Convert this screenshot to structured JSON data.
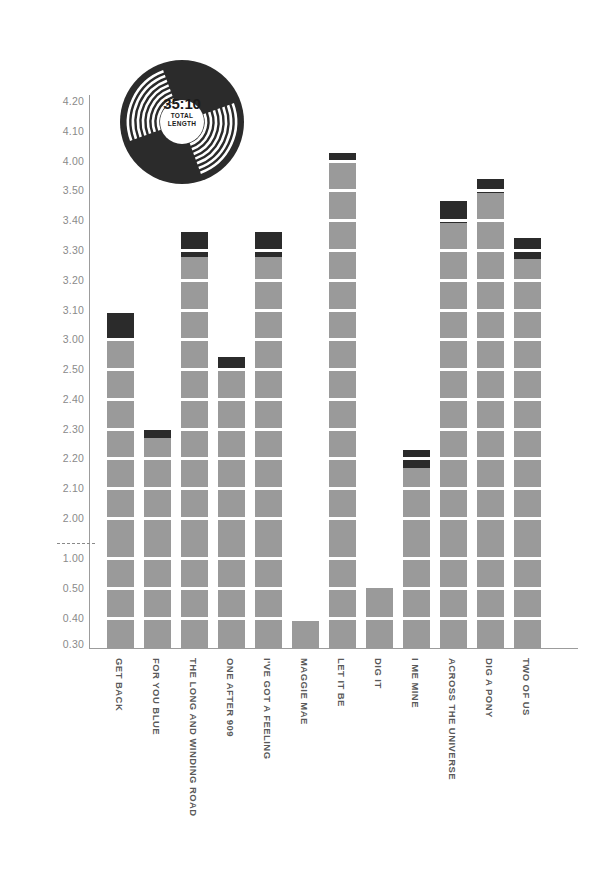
{
  "badge": {
    "total_length": "35:10",
    "caption_line1": "TOTAL",
    "caption_line2": "LENGTH",
    "icon": "vinyl-record-icon"
  },
  "colors": {
    "bar": "#9a9a9a",
    "bar_cap": "#2b2b2b",
    "axis": "#9c9c9c",
    "tick_text": "#8a8a8a",
    "label_text": "#595959",
    "background": "#ffffff"
  },
  "axis": {
    "y_ticks": [
      "4.20",
      "4.10",
      "4.00",
      "3.50",
      "3.40",
      "3.30",
      "3.20",
      "3.10",
      "3.00",
      "2.50",
      "2.40",
      "2.30",
      "2.20",
      "2.10",
      "2.00",
      "1.00",
      "0.50",
      "0.40",
      "0.30"
    ],
    "break_after": "2.00",
    "break_marker": "dashed"
  },
  "chart_data": {
    "type": "bar",
    "title": "",
    "subtitle": "",
    "xlabel": "",
    "ylabel": "",
    "grid": true,
    "legend": "none",
    "note": "Track lengths in minutes:seconds shown as min.sec on a broken y-axis; dark cap marks the seconds portion above the last whole gridline.",
    "ylim": [
      0.3,
      4.25
    ],
    "categories": [
      "GET BACK",
      "FOR YOU BLUE",
      "THE LONG AND WINDING ROAD",
      "ONE AFTER 909",
      "I'VE GOT A FEELING",
      "MAGGIE MAE",
      "LET IT BE",
      "DIG IT",
      "I ME MINE",
      "ACROSS THE UNIVERSE",
      "DIG A PONY",
      "TWO OF US"
    ],
    "values": [
      3.09,
      2.32,
      3.38,
      2.57,
      3.38,
      0.39,
      4.03,
      0.5,
      2.25,
      3.48,
      3.54,
      3.37
    ],
    "cap_from": [
      3.0,
      2.3,
      3.3,
      2.5,
      3.3,
      0.39,
      4.0,
      0.5,
      2.2,
      3.4,
      3.5,
      3.3
    ]
  },
  "bars": [
    {
      "label": "GET BACK",
      "value": "3.09",
      "x": 107,
      "top": 313,
      "cap_height": 26
    },
    {
      "label": "FOR YOU BLUE",
      "value": "2.32",
      "x": 144,
      "top": 430,
      "cap_height": 8
    },
    {
      "label": "THE LONG AND WINDING ROAD",
      "value": "3.38",
      "x": 181,
      "top": 232,
      "cap_height": 25
    },
    {
      "label": "ONE AFTER 909",
      "value": "2.57",
      "x": 218,
      "top": 357,
      "cap_height": 12
    },
    {
      "label": "I'VE GOT A FEELING",
      "value": "3.38",
      "x": 255,
      "top": 232,
      "cap_height": 25
    },
    {
      "label": "MAGGIE MAE",
      "value": "0.39",
      "x": 292,
      "top": 621,
      "cap_height": 0
    },
    {
      "label": "LET IT BE",
      "value": "4.03",
      "x": 329,
      "top": 153,
      "cap_height": 10
    },
    {
      "label": "DIG IT",
      "value": "0.50",
      "x": 366,
      "top": 588,
      "cap_height": 0
    },
    {
      "label": "I ME MINE",
      "value": "2.25",
      "x": 403,
      "top": 450,
      "cap_height": 18
    },
    {
      "label": "ACROSS THE UNIVERSE",
      "value": "3.48",
      "x": 440,
      "top": 201,
      "cap_height": 22
    },
    {
      "label": "DIG A PONY",
      "value": "3.54",
      "x": 477,
      "top": 179,
      "cap_height": 14
    },
    {
      "label": "TWO OF US",
      "value": "3.37",
      "x": 514,
      "top": 238,
      "cap_height": 21
    }
  ],
  "tick_positions": [
    {
      "label": "4.20",
      "y": 101
    },
    {
      "label": "4.10",
      "y": 131
    },
    {
      "label": "4.00",
      "y": 161
    },
    {
      "label": "3.50",
      "y": 190
    },
    {
      "label": "3.40",
      "y": 220
    },
    {
      "label": "3.30",
      "y": 250
    },
    {
      "label": "3.20",
      "y": 280
    },
    {
      "label": "3.10",
      "y": 310
    },
    {
      "label": "3.00",
      "y": 339
    },
    {
      "label": "2.50",
      "y": 369
    },
    {
      "label": "2.40",
      "y": 399
    },
    {
      "label": "2.30",
      "y": 429
    },
    {
      "label": "2.20",
      "y": 458
    },
    {
      "label": "2.10",
      "y": 488
    },
    {
      "label": "2.00",
      "y": 518
    },
    {
      "label": "1.00",
      "y": 558
    },
    {
      "label": "0.50",
      "y": 588
    },
    {
      "label": "0.40",
      "y": 618
    },
    {
      "label": "0.30",
      "y": 644
    }
  ]
}
